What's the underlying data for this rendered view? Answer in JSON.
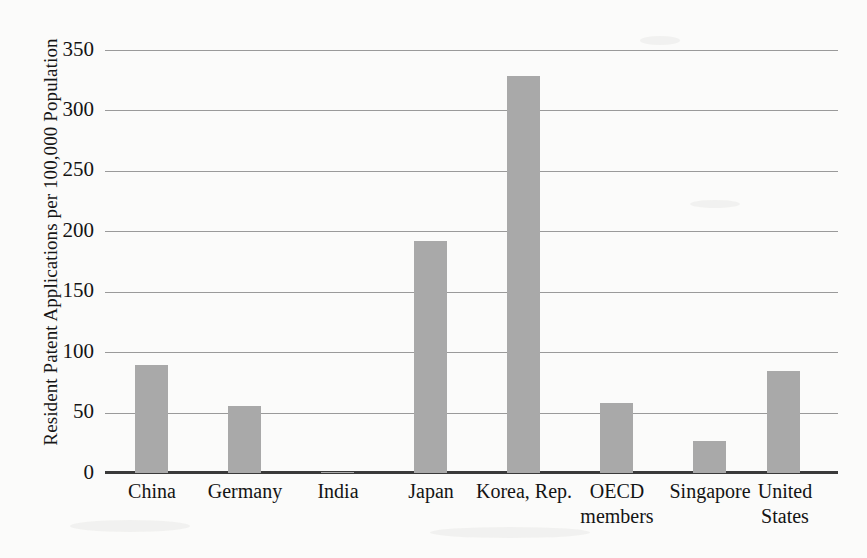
{
  "chart_data": {
    "type": "bar",
    "title": "",
    "xlabel": "",
    "ylabel": "Resident Patent Applications per 100,000 Population",
    "categories": [
      "China",
      "Germany",
      "India",
      "Japan",
      "Korea, Rep.",
      "OECD members",
      "Singapore",
      "United States"
    ],
    "values": [
      90,
      56,
      1,
      193,
      330,
      58,
      27,
      85
    ],
    "ylim": [
      0,
      350
    ],
    "yticks": [
      0,
      50,
      100,
      150,
      200,
      250,
      300,
      350
    ],
    "ytick_labels": [
      "0",
      "50",
      "100",
      "150",
      "200",
      "250",
      "300",
      "350"
    ],
    "grid": true,
    "legend": "none",
    "bar_color": "#a9a9a9",
    "axis_color": "#3a3a3a",
    "gridline_color": "#9a9a9a",
    "background_color": "#fbfbfa"
  },
  "axis": {
    "y_title": "Resident Patent Applications per 100,000 Population"
  },
  "categories_multiline": [
    {
      "line1": "China",
      "line2": ""
    },
    {
      "line1": "Germany",
      "line2": ""
    },
    {
      "line1": "India",
      "line2": ""
    },
    {
      "line1": "Japan",
      "line2": ""
    },
    {
      "line1": "Korea, Rep.",
      "line2": ""
    },
    {
      "line1": "OECD",
      "line2": "members"
    },
    {
      "line1": "Singapore",
      "line2": ""
    },
    {
      "line1": "United",
      "line2": "States"
    }
  ]
}
